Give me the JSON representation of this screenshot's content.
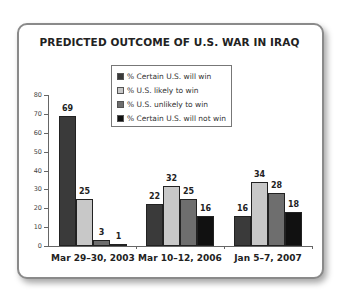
{
  "chart_data": {
    "type": "bar",
    "title": "PREDICTED OUTCOME OF U.S. WAR IN IRAQ",
    "categories": [
      "Mar 29–30, 2003",
      "Mar 10–12, 2006",
      "Jan 5–7, 2007"
    ],
    "series": [
      {
        "name": "% Certain U.S. will win",
        "color": "#3a3a3a",
        "values": [
          69,
          22,
          16
        ]
      },
      {
        "name": "% U.S. likely to win",
        "color": "#c8c8c8",
        "values": [
          25,
          32,
          34
        ]
      },
      {
        "name": "% U.S. unlikely to win",
        "color": "#6e6e6e",
        "values": [
          3,
          25,
          28
        ]
      },
      {
        "name": "% Certain U.S. will not win",
        "color": "#111111",
        "values": [
          1,
          16,
          18
        ]
      }
    ],
    "xlabel": "",
    "ylabel": "",
    "ylim": [
      0,
      80
    ],
    "yticks": [
      0,
      10,
      20,
      30,
      40,
      50,
      60,
      70,
      80
    ],
    "grid": false,
    "legend_position": "top-center"
  }
}
